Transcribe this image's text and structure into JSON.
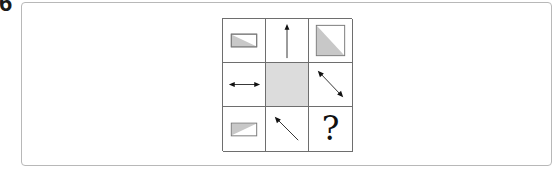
{
  "question": {
    "number": "6"
  },
  "puzzle": {
    "rows": 3,
    "cols": 3,
    "colors": {
      "grid_line": "#6e6e6e",
      "shape_fill": "#c8c8c8",
      "shape_stroke": "#7a7a7a",
      "center_fill": "#dcdcdc",
      "arrow": "#333333"
    },
    "cells": [
      {
        "row": 1,
        "col": 1,
        "content": "wide-rectangle-lower-left-triangle-shaded"
      },
      {
        "row": 1,
        "col": 2,
        "content": "arrow-up"
      },
      {
        "row": 1,
        "col": 3,
        "content": "square-lower-left-triangle-shaded"
      },
      {
        "row": 2,
        "col": 1,
        "content": "arrow-left-right"
      },
      {
        "row": 2,
        "col": 2,
        "content": "blank-shaded-cell"
      },
      {
        "row": 2,
        "col": 3,
        "content": "arrow-diagonal-double"
      },
      {
        "row": 3,
        "col": 1,
        "content": "wide-rectangle-upper-left-triangle-shaded"
      },
      {
        "row": 3,
        "col": 2,
        "content": "arrow-up-left"
      },
      {
        "row": 3,
        "col": 3,
        "content": "question-mark"
      }
    ],
    "missing_label": "?"
  }
}
